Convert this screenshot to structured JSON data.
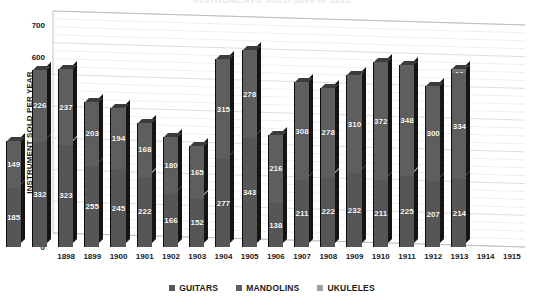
{
  "chart_data": {
    "type": "bar",
    "subtype": "stacked-column-3d",
    "title": "INSTRUMENTS SOLD 1898 to 1915",
    "xlabel": "",
    "ylabel": "INSTRUMENT SOLD PER YEAR",
    "ylim": [
      0,
      700
    ],
    "ytick_step": 100,
    "yticks": [
      0,
      100,
      200,
      300,
      400,
      500,
      600,
      700
    ],
    "grid": true,
    "legend_position": "bottom",
    "categories": [
      "1898",
      "1899",
      "1900",
      "1901",
      "1902",
      "1903",
      "1904",
      "1905",
      "1906",
      "1907",
      "1908",
      "1909",
      "1910",
      "1911",
      "1912",
      "1913",
      "1914",
      "1915"
    ],
    "series": [
      {
        "name": "GUITARS",
        "color": "#565656",
        "values": [
          185,
          332,
          323,
          255,
          245,
          222,
          166,
          152,
          277,
          343,
          138,
          211,
          222,
          232,
          211,
          225,
          207,
          214
        ]
      },
      {
        "name": "MANDOLINS",
        "color": "#5e5e5e",
        "values": [
          149,
          226,
          237,
          203,
          194,
          168,
          180,
          165,
          315,
          278,
          216,
          308,
          278,
          310,
          372,
          348,
          300,
          334
        ]
      },
      {
        "name": "UKULELES",
        "color": "#747474",
        "values": [
          0,
          0,
          0,
          0,
          0,
          0,
          0,
          0,
          0,
          0,
          0,
          0,
          0,
          0,
          0,
          0,
          0,
          12
        ]
      }
    ],
    "totals": [
      334,
      558,
      560,
      458,
      439,
      390,
      346,
      317,
      592,
      621,
      354,
      519,
      500,
      542,
      583,
      573,
      507,
      560
    ]
  },
  "legend": {
    "items": [
      {
        "label": "GUITARS",
        "color": "#565656"
      },
      {
        "label": "MANDOLINS",
        "color": "#5e5e5e"
      },
      {
        "label": "UKULELES",
        "color": "#a0a0a0"
      }
    ]
  }
}
